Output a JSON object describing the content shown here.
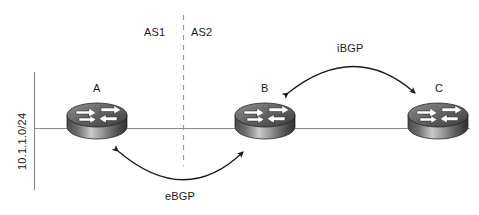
{
  "diagram": {
    "type": "network-topology",
    "background_color": "#ffffff",
    "line_color": "#808080",
    "arc_color": "#1a1a1a",
    "text_color": "#1a1a1a",
    "subnet_label": "10.1.1.0/24",
    "as_boundary": {
      "left_label": "AS1",
      "right_label": "AS2",
      "style": "dashed-vertical"
    },
    "routers": [
      {
        "id": "A",
        "label": "A",
        "cx": 97,
        "cy": 122,
        "icon": "router-icon"
      },
      {
        "id": "B",
        "label": "B",
        "cx": 265,
        "cy": 122,
        "icon": "router-icon"
      },
      {
        "id": "C",
        "label": "C",
        "cx": 438,
        "cy": 122,
        "icon": "router-icon"
      }
    ],
    "sessions": [
      {
        "id": "ebgp",
        "label": "eBGP",
        "from": "A",
        "to": "B",
        "direction": "bidirectional",
        "curve": "below"
      },
      {
        "id": "ibgp",
        "label": "iBGP",
        "from": "B",
        "to": "C",
        "direction": "bidirectional",
        "curve": "above"
      }
    ],
    "links": [
      {
        "id": "link-segment-a-b",
        "from": "A",
        "to": "B"
      },
      {
        "id": "link-segment-b-c",
        "from": "B",
        "to": "C"
      }
    ]
  }
}
